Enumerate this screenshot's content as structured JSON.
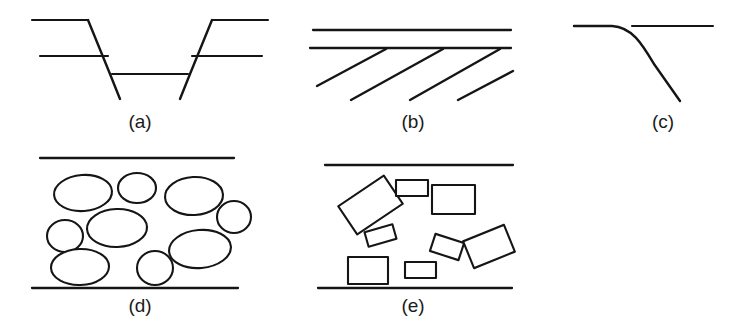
{
  "figure": {
    "name": "structural-geology-deformation-styles",
    "background_color": "#ffffff",
    "ink_color": "#151515",
    "width": 750,
    "height": 324,
    "panel_count": 5
  },
  "panels": [
    {
      "id": "a",
      "caption": "(a)",
      "caption_x": 140,
      "caption_y": 128,
      "description": "graben bounded by two conjugate normal faults offsetting two marker horizons",
      "elements": {
        "faults": [
          {
            "name": "left-normal-fault",
            "points": "88,20 110,74 120,99"
          },
          {
            "name": "right-normal-fault",
            "points": "212,20 190,74 180,99"
          }
        ],
        "markers_upper": [
          {
            "name": "upper-marker-left",
            "points": "32,20 88,20"
          },
          {
            "name": "upper-marker-right",
            "points": "212,20 268,20"
          }
        ],
        "markers_middle": [
          {
            "name": "middle-marker-left",
            "points": "40,56 108,56"
          },
          {
            "name": "middle-marker-right",
            "points": "192,56 262,56"
          }
        ],
        "markers_downthrown": [
          {
            "name": "downthrown-marker",
            "points": "112,74 188,74"
          }
        ]
      }
    },
    {
      "id": "b",
      "caption": "(b)",
      "caption_x": 413,
      "caption_y": 128,
      "description": "detachment horizon above a set of parallel inclined shear planes (domino / imbricate array)",
      "elements": {
        "horizontals": [
          {
            "name": "upper-detachment-line",
            "points": "313,30 511,30"
          },
          {
            "name": "lower-detachment-line",
            "points": "310,48 511,48"
          }
        ],
        "shear_planes": [
          {
            "name": "shear-plane-1",
            "points": "386,49 317,86"
          },
          {
            "name": "shear-plane-2",
            "points": "443,49 351,100"
          },
          {
            "name": "shear-plane-3",
            "points": "500,49 410,100"
          },
          {
            "name": "shear-plane-4",
            "points": "513,71 458,100"
          }
        ]
      }
    },
    {
      "id": "c",
      "caption": "(c)",
      "caption_x": 663,
      "caption_y": 128,
      "description": "listric normal fault flattening downward, with displaced hanging-wall horizon",
      "elements": {
        "listric_fault": {
          "name": "listric-fault-curve",
          "path": "M 574,26 L 612,26 C 632,27 642,44 654,64 L 680,101"
        },
        "horizon": {
          "name": "offset-horizon",
          "points": "632,26 713,26"
        }
      }
    },
    {
      "id": "d",
      "caption": "(d)",
      "caption_x": 140,
      "caption_y": 312,
      "description": "shear zone with rounded (elliptical) clasts between two boundary lines",
      "elements": {
        "boundaries": [
          {
            "name": "upper-shear-boundary",
            "points": "40,158 234,158"
          },
          {
            "name": "lower-shear-boundary",
            "points": "32,288 238,288"
          }
        ],
        "clasts": [
          {
            "name": "ellipse-clast-1",
            "cx": 83,
            "cy": 193,
            "rx": 29,
            "ry": 18,
            "rot": -4
          },
          {
            "name": "ellipse-clast-2",
            "cx": 137,
            "cy": 188,
            "rx": 19,
            "ry": 15,
            "rot": 0
          },
          {
            "name": "ellipse-clast-3",
            "cx": 194,
            "cy": 196,
            "rx": 29,
            "ry": 19,
            "rot": -3
          },
          {
            "name": "ellipse-clast-4",
            "cx": 234,
            "cy": 217,
            "rx": 17,
            "ry": 16,
            "rot": 0
          },
          {
            "name": "ellipse-clast-5",
            "cx": 117,
            "cy": 228,
            "rx": 30,
            "ry": 19,
            "rot": -2
          },
          {
            "name": "ellipse-clast-6",
            "cx": 65,
            "cy": 236,
            "rx": 18,
            "ry": 16,
            "rot": 0
          },
          {
            "name": "ellipse-clast-7",
            "cx": 200,
            "cy": 249,
            "rx": 31,
            "ry": 19,
            "rot": -5
          },
          {
            "name": "ellipse-clast-8",
            "cx": 80,
            "cy": 267,
            "rx": 29,
            "ry": 18,
            "rot": -2
          },
          {
            "name": "ellipse-clast-9",
            "cx": 155,
            "cy": 268,
            "rx": 18,
            "ry": 17,
            "rot": 0
          }
        ]
      }
    },
    {
      "id": "e",
      "caption": "(e)",
      "caption_x": 413,
      "caption_y": 312,
      "description": "shear zone with angular (rectangular) rotated clasts between two boundary lines",
      "elements": {
        "boundaries": [
          {
            "name": "upper-shear-boundary",
            "points": "325,165 513,165"
          },
          {
            "name": "lower-shear-boundary",
            "points": "318,288 512,288"
          }
        ],
        "clasts": [
          {
            "name": "rect-clast-1",
            "x": 343,
            "y": 188,
            "w": 55,
            "h": 34,
            "rot": -34
          },
          {
            "name": "rect-clast-2",
            "x": 396,
            "y": 180,
            "w": 32,
            "h": 16,
            "rot": 0
          },
          {
            "name": "rect-clast-3",
            "x": 432,
            "y": 185,
            "w": 43,
            "h": 29,
            "rot": 0
          },
          {
            "name": "rect-clast-4",
            "x": 366,
            "y": 228,
            "w": 29,
            "h": 15,
            "rot": -16
          },
          {
            "name": "rect-clast-5",
            "x": 432,
            "y": 238,
            "w": 30,
            "h": 18,
            "rot": 18
          },
          {
            "name": "rect-clast-6",
            "x": 467,
            "y": 232,
            "w": 44,
            "h": 29,
            "rot": -22
          },
          {
            "name": "rect-clast-7",
            "x": 348,
            "y": 257,
            "w": 40,
            "h": 27,
            "rot": 0
          },
          {
            "name": "rect-clast-8",
            "x": 405,
            "y": 262,
            "w": 31,
            "h": 16,
            "rot": 0
          }
        ]
      }
    }
  ]
}
